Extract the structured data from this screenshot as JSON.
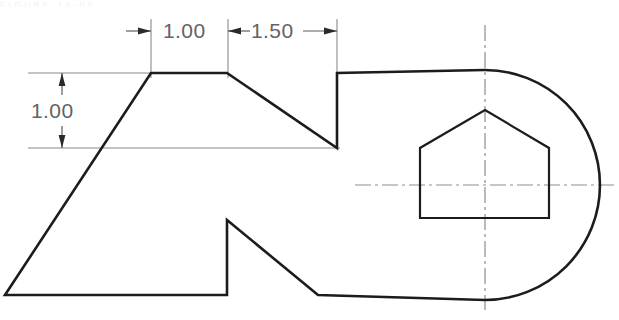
{
  "drawing": {
    "title_artifact": "FIGURE 16-05",
    "background_color": "#ffffff",
    "line_color": "#1c1c1c",
    "dimension_color": "#636363",
    "centerline_color": "#8d8d8d",
    "width": 619,
    "height": 320
  },
  "dimensions": {
    "horizontal": [
      {
        "id": "dim-h1",
        "value": "1.00",
        "x1": 151,
        "x2": 228,
        "y": 31
      },
      {
        "id": "dim-h2",
        "value": "1.50",
        "x1": 228,
        "x2": 337,
        "y": 31
      }
    ],
    "vertical": [
      {
        "id": "dim-v1",
        "value": "1.00",
        "y1": 73,
        "y2": 148,
        "x": 62
      }
    ]
  },
  "geometry": {
    "outline_points": "151,73 227,73 337,148 337,73 485,70 520,76 560,97 590,132 600,185 590,238 560,273 520,294 318,295 227,220 227,295 5,295 151,73",
    "outline_description": "Irregular plate outline with sloped left face, top plateau, stepped notch, rounded right end",
    "pentagon_points": "485,110 549,148 549,218 420,218 420,148",
    "pentagon_description": "Regular pentagon cutout centered on the rounded end",
    "arc": {
      "center_x": 485,
      "center_y": 185,
      "radius": 115
    },
    "centerlines": {
      "vertical": {
        "x": 485,
        "y1": 25,
        "y2": 310
      },
      "horizontal": {
        "y": 185,
        "x1": 355,
        "x2": 616
      }
    }
  },
  "labels": {
    "dim_h1": "1.00",
    "dim_h2": "1.50",
    "dim_v1": "1.00"
  }
}
